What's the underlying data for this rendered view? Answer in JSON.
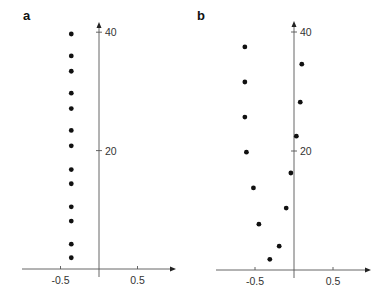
{
  "chart_data": [
    {
      "type": "scatter",
      "panel": "a",
      "title": "",
      "xlabel": "",
      "ylabel": "",
      "xlim": [
        -0.95,
        1.0
      ],
      "ylim": [
        0,
        41
      ],
      "x_ticks": [
        -0.5,
        0.5
      ],
      "x_tick_labels": [
        "-0.5",
        "0.5"
      ],
      "y_ticks": [
        20,
        40
      ],
      "y_tick_labels": [
        "20",
        "40"
      ],
      "grid": false,
      "legend": null,
      "points": [
        {
          "x": -0.36,
          "y": 39.7
        },
        {
          "x": -0.36,
          "y": 36.0
        },
        {
          "x": -0.36,
          "y": 33.4
        },
        {
          "x": -0.36,
          "y": 29.7
        },
        {
          "x": -0.36,
          "y": 27.1
        },
        {
          "x": -0.36,
          "y": 23.4
        },
        {
          "x": -0.36,
          "y": 20.8
        },
        {
          "x": -0.36,
          "y": 16.8
        },
        {
          "x": -0.36,
          "y": 14.4
        },
        {
          "x": -0.36,
          "y": 10.5
        },
        {
          "x": -0.36,
          "y": 8.1
        },
        {
          "x": -0.36,
          "y": 4.2
        },
        {
          "x": -0.36,
          "y": 1.9
        }
      ]
    },
    {
      "type": "scatter",
      "panel": "b",
      "title": "",
      "xlabel": "",
      "ylabel": "",
      "xlim": [
        -1.0,
        1.0
      ],
      "ylim": [
        0,
        41
      ],
      "x_ticks": [
        -0.5,
        0.5
      ],
      "x_tick_labels": [
        "-0.5",
        "0.5"
      ],
      "y_ticks": [
        20,
        40
      ],
      "y_tick_labels": [
        "20",
        "40"
      ],
      "grid": false,
      "legend": null,
      "points": [
        {
          "x": -0.63,
          "y": 37.5
        },
        {
          "x": 0.1,
          "y": 34.6
        },
        {
          "x": -0.63,
          "y": 31.6
        },
        {
          "x": 0.08,
          "y": 28.2
        },
        {
          "x": -0.63,
          "y": 25.7
        },
        {
          "x": 0.03,
          "y": 22.5
        },
        {
          "x": -0.61,
          "y": 19.8
        },
        {
          "x": -0.04,
          "y": 16.3
        },
        {
          "x": -0.52,
          "y": 13.8
        },
        {
          "x": -0.1,
          "y": 10.4
        },
        {
          "x": -0.45,
          "y": 7.7
        },
        {
          "x": -0.19,
          "y": 4.0
        },
        {
          "x": -0.31,
          "y": 1.8
        }
      ]
    }
  ],
  "panels": [
    {
      "label": "a"
    },
    {
      "label": "b"
    }
  ],
  "colors": {
    "axis": "#555555",
    "point": "#111111",
    "text": "#333333"
  }
}
